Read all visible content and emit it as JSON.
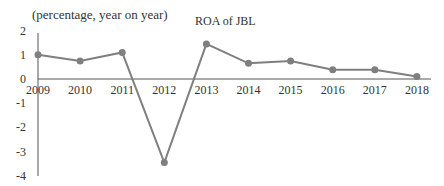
{
  "chart_data": {
    "type": "line",
    "title": "ROA of JBL",
    "ylabel": "(percentage, year on year)",
    "xlabel": "",
    "categories": [
      "2009",
      "2010",
      "2011",
      "2012",
      "2013",
      "2014",
      "2015",
      "2016",
      "2017",
      "2018"
    ],
    "series": [
      {
        "name": "ROA of JBL",
        "values": [
          1.0,
          0.75,
          1.1,
          -3.45,
          1.45,
          0.65,
          0.75,
          0.38,
          0.38,
          0.1
        ],
        "color": "#7f7f7f"
      }
    ],
    "yticks": [
      "2",
      "1",
      "0",
      "-1",
      "-2",
      "-3",
      "-4"
    ],
    "ylim": [
      -4,
      2
    ],
    "grid": false,
    "legend": "none"
  }
}
